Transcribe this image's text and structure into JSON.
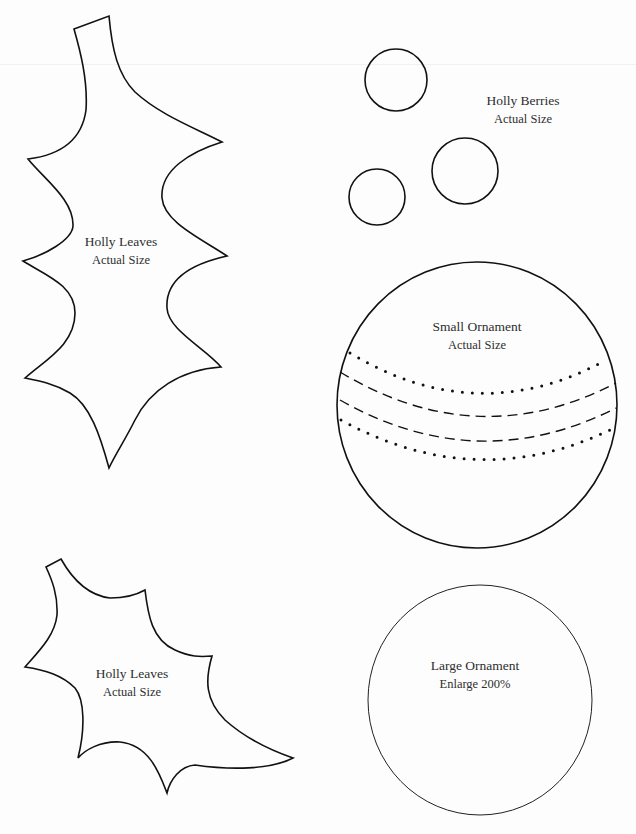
{
  "page": {
    "background": "#fdfdfd",
    "stroke_color": "#111111",
    "text_color": "#2e2e2e"
  },
  "templates": {
    "holly_leaf_large": {
      "title": "Holly Leaves",
      "subtitle": "Actual Size"
    },
    "holly_berries": {
      "title": "Holly Berries",
      "subtitle": "Actual Size",
      "count": 3
    },
    "small_ornament": {
      "title": "Small Ornament",
      "subtitle": "Actual Size",
      "stitch_lines": [
        {
          "style": "dotted"
        },
        {
          "style": "dashed"
        },
        {
          "style": "dashed"
        },
        {
          "style": "dotted"
        }
      ]
    },
    "holly_leaf_small": {
      "title": "Holly Leaves",
      "subtitle": "Actual Size"
    },
    "large_ornament": {
      "title": "Large Ornament",
      "subtitle": "Enlarge 200%"
    }
  }
}
